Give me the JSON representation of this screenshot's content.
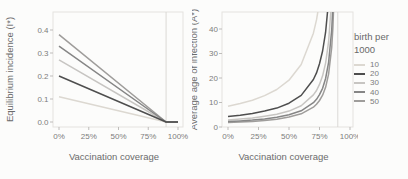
{
  "figure": {
    "bg": "#fcfcfb",
    "title_color": "#6b6b6b",
    "tick_text_color": "#7c7c7c",
    "panel_border_color": "#e4e2df",
    "guide_line_color": "#d7d5d1",
    "tick_mark_color": "#b8b6b3"
  },
  "legend": {
    "title_line1": "birth per",
    "title_line2": "1000",
    "items": [
      {
        "label": "10",
        "color": "#dcd8d1"
      },
      {
        "label": "20",
        "color": "#4e4e4e"
      },
      {
        "label": "30",
        "color": "#c7c5c2"
      },
      {
        "label": "40",
        "color": "#868686"
      },
      {
        "label": "50",
        "color": "#9f9d9b"
      }
    ]
  },
  "chart_data": [
    {
      "type": "line",
      "panel": "left",
      "title": "",
      "xlabel": "Vaccination coverage",
      "ylabel": "Equilibrium incidence (I*)",
      "x_tick_labels": [
        "0%",
        "25%",
        "50%",
        "75%",
        "100%"
      ],
      "x_tick_values": [
        0,
        0.25,
        0.5,
        0.75,
        1.0
      ],
      "y_tick_labels": [
        "0.0",
        "0.1",
        "0.2",
        "0.3",
        "0.4"
      ],
      "y_tick_values": [
        0,
        0.1,
        0.2,
        0.3,
        0.4
      ],
      "xlim": [
        -0.05,
        1.05
      ],
      "ylim": [
        0,
        0.478
      ],
      "grid": false,
      "guide_x": 0.9,
      "x": [
        0,
        0.9,
        1.0
      ],
      "series": [
        {
          "name": "10",
          "values": [
            0.11,
            0.0,
            0.0
          ]
        },
        {
          "name": "20",
          "values": [
            0.2,
            0.0,
            0.0
          ]
        },
        {
          "name": "30",
          "values": [
            0.27,
            0.0,
            0.0
          ]
        },
        {
          "name": "40",
          "values": [
            0.33,
            0.0,
            0.0
          ]
        },
        {
          "name": "50",
          "values": [
            0.38,
            0.0,
            0.0
          ]
        }
      ]
    },
    {
      "type": "line",
      "panel": "right",
      "title": "",
      "xlabel": "Vaccination coverage",
      "ylabel": "Average age of infection (A*)",
      "x_tick_labels": [
        "0%",
        "25%",
        "50%",
        "75%",
        "100%"
      ],
      "x_tick_values": [
        0,
        0.25,
        0.5,
        0.75,
        1.0
      ],
      "y_tick_labels": [
        "0",
        "10",
        "20",
        "30",
        "40"
      ],
      "y_tick_values": [
        0,
        10,
        20,
        30,
        40
      ],
      "xlim": [
        -0.05,
        1.05
      ],
      "ylim": [
        0,
        46.9
      ],
      "grid": false,
      "guide_x": 0.9,
      "x": [
        0,
        0.1,
        0.2,
        0.3,
        0.4,
        0.5,
        0.6,
        0.7,
        0.725,
        0.75,
        0.775,
        0.8,
        0.825,
        0.85,
        0.86,
        0.87,
        0.88,
        0.885,
        0.89
      ],
      "series": [
        {
          "name": "10",
          "values": [
            8.5,
            9.6,
            10.9,
            12.8,
            15.3,
            19.1,
            25.5,
            38.3,
            43.7,
            51.0,
            61.2,
            76.5,
            102.0,
            153.0,
            191.3,
            255.0,
            382.5,
            510.0,
            765.0
          ]
        },
        {
          "name": "20",
          "values": [
            4.3,
            4.8,
            5.5,
            6.5,
            7.7,
            9.7,
            12.9,
            19.4,
            22.1,
            25.8,
            31.0,
            38.7,
            51.6,
            77.4,
            96.8,
            129.0,
            193.5,
            258.0,
            387.0
          ]
        },
        {
          "name": "30",
          "values": [
            2.9,
            3.3,
            3.7,
            4.4,
            5.2,
            6.5,
            8.7,
            13.1,
            14.9,
            17.4,
            20.9,
            26.1,
            34.8,
            52.2,
            65.3,
            87.0,
            130.5,
            174.0,
            261.0
          ]
        },
        {
          "name": "40",
          "values": [
            2.2,
            2.5,
            2.8,
            3.3,
            4.0,
            5.0,
            6.6,
            9.9,
            11.3,
            13.2,
            15.8,
            19.8,
            26.4,
            39.6,
            49.5,
            66.0,
            99.0,
            132.0,
            198.0
          ]
        },
        {
          "name": "50",
          "values": [
            1.8,
            2.0,
            2.3,
            2.7,
            3.2,
            4.1,
            5.4,
            8.1,
            9.3,
            10.8,
            13.0,
            16.2,
            21.6,
            32.4,
            40.5,
            54.0,
            81.0,
            108.0,
            162.0
          ]
        }
      ]
    }
  ]
}
